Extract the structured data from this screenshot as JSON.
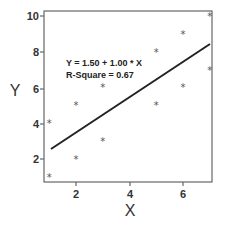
{
  "chart_data": {
    "type": "scatter",
    "title": "",
    "xlabel": "X",
    "ylabel": "Y",
    "xlim": [
      0.8,
      7.1
    ],
    "ylim": [
      0.6,
      10.3
    ],
    "xticks": [
      2,
      4,
      6
    ],
    "yticks": [
      2,
      4,
      6,
      8,
      10
    ],
    "grid": false,
    "legend": null,
    "marker": "*",
    "series": [
      {
        "name": "observations",
        "x": [
          1,
          1,
          2,
          2,
          3,
          3,
          5,
          5,
          6,
          6,
          7,
          7
        ],
        "y": [
          4,
          1,
          5,
          2,
          6,
          3,
          8,
          5,
          9,
          6,
          10,
          7
        ]
      }
    ],
    "fit_line": {
      "intercept": 1.5,
      "slope": 1.0,
      "x_range": [
        1.1,
        7.0
      ]
    },
    "annotations": [
      "Y = 1.50 + 1.00 * X",
      "R-Square = 0.67"
    ]
  },
  "labels": {
    "x_axis": "X",
    "y_axis": "Y",
    "equation": "Y = 1.50 + 1.00 * X",
    "r_square": "R-Square = 0.67",
    "x_ticks": [
      "2",
      "4",
      "6"
    ],
    "y_ticks": [
      "2",
      "4",
      "6",
      "8",
      "10"
    ]
  }
}
